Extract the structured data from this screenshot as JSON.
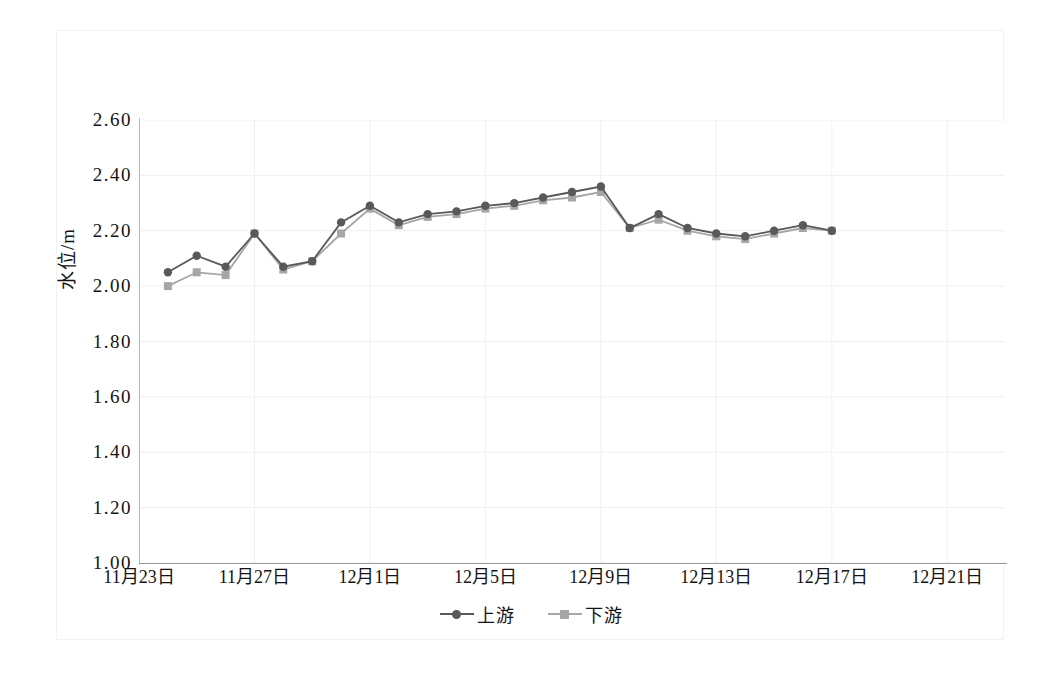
{
  "chart_data": {
    "type": "line",
    "title": "",
    "subtitle": "",
    "xlabel": "",
    "ylabel": "水位/m",
    "ylim": [
      1.0,
      2.6
    ],
    "ytick_step": 0.2,
    "ytick_labels": [
      "2.60",
      "2.40",
      "2.20",
      "2.00",
      "1.80",
      "1.60",
      "1.40",
      "1.20",
      "1.00"
    ],
    "ytick_values": [
      2.6,
      2.4,
      2.2,
      2.0,
      1.8,
      1.6,
      1.4,
      1.2,
      1.0
    ],
    "xtick_labels": [
      "11月23日",
      "11月27日",
      "12月1日",
      "12月5日",
      "12月9日",
      "12月13日",
      "12月17日",
      "12月21日"
    ],
    "xtick_day_index": [
      0,
      4,
      8,
      12,
      16,
      20,
      24,
      28
    ],
    "x_axis_day_span": 30,
    "grid": {
      "vertical": true,
      "horizontal": true,
      "color": "#f0f0f0"
    },
    "legend": {
      "position": "bottom-center",
      "entries": [
        "上游",
        "下游"
      ]
    },
    "x": [
      1,
      2,
      3,
      4,
      5,
      6,
      7,
      8,
      9,
      10,
      11,
      12,
      13,
      14,
      15,
      16,
      17,
      18,
      19,
      20,
      21,
      22,
      23,
      24
    ],
    "series": [
      {
        "name": "上游",
        "color": "#595959",
        "marker": "circle",
        "values": [
          2.05,
          2.11,
          2.07,
          2.19,
          2.07,
          2.09,
          2.23,
          2.29,
          2.23,
          2.26,
          2.27,
          2.29,
          2.3,
          2.32,
          2.34,
          2.36,
          2.21,
          2.26,
          2.21,
          2.19,
          2.18,
          2.2,
          2.22,
          2.2
        ]
      },
      {
        "name": "下游",
        "color": "#a6a6a6",
        "marker": "square",
        "values": [
          2.0,
          2.05,
          2.04,
          2.19,
          2.06,
          2.09,
          2.19,
          2.28,
          2.22,
          2.25,
          2.26,
          2.28,
          2.29,
          2.31,
          2.32,
          2.34,
          2.21,
          2.24,
          2.2,
          2.18,
          2.17,
          2.19,
          2.21,
          2.2
        ]
      }
    ]
  },
  "colors": {
    "upstream": "#595959",
    "downstream": "#a6a6a6",
    "axis": "#9a9a9a",
    "grid": "#f0f0f0",
    "text": "#141414"
  }
}
